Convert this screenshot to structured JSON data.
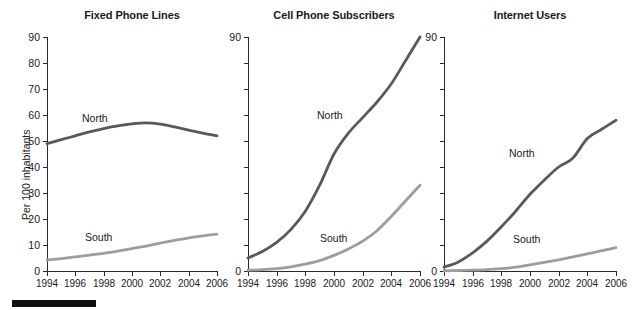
{
  "figure": {
    "width": 626,
    "height": 310,
    "background": "#ffffff",
    "axis_color": "#2a2a2a",
    "text_color": "#1a1a1a",
    "footer_bar_color": "#111111",
    "ylabel": "Per 100 inhabitants"
  },
  "series_colors": {
    "north": "#595959",
    "south": "#9d9d9d"
  },
  "chart_data": [
    {
      "type": "line",
      "title": "Fixed Phone Lines",
      "xlabel": "",
      "ylabel": "Per 100 inhabitants",
      "x": [
        1994,
        1995,
        1996,
        1997,
        1998,
        1999,
        2000,
        2001,
        2002,
        2003,
        2004,
        2005,
        2006
      ],
      "xticks": [
        "1994",
        "1996",
        "1998",
        "2000",
        "2002",
        "2004",
        "2006"
      ],
      "yticks": [
        "0",
        "10",
        "20",
        "30",
        "40",
        "50",
        "60",
        "70",
        "80",
        "90"
      ],
      "ylim": [
        0,
        90
      ],
      "xlim": [
        1994,
        2006
      ],
      "grid": false,
      "legend": "inline-labels",
      "series": [
        {
          "name": "North",
          "color": "#595959",
          "values": [
            49.0,
            50.5,
            52.0,
            53.5,
            54.8,
            55.8,
            56.6,
            57.0,
            56.5,
            55.4,
            54.2,
            53.0,
            52.0
          ]
        },
        {
          "name": "South",
          "color": "#9d9d9d",
          "values": [
            4.3,
            4.8,
            5.4,
            6.1,
            6.8,
            7.6,
            8.6,
            9.6,
            10.7,
            11.8,
            12.7,
            13.5,
            14.2
          ]
        }
      ]
    },
    {
      "type": "line",
      "title": "Cell Phone Subscribers",
      "xlabel": "",
      "ylabel": "",
      "x": [
        1994,
        1995,
        1996,
        1997,
        1998,
        1999,
        2000,
        2001,
        2002,
        2003,
        2004,
        2005,
        2006
      ],
      "xticks": [
        "1994",
        "1996",
        "1998",
        "2000",
        "2002",
        "2004",
        "2006"
      ],
      "yticks": [
        "0",
        "90"
      ],
      "ylim": [
        0,
        90
      ],
      "xlim": [
        1994,
        2006
      ],
      "grid": false,
      "legend": "inline-labels",
      "series": [
        {
          "name": "North",
          "color": "#595959",
          "values": [
            5.0,
            7.5,
            11.0,
            16.0,
            23.0,
            33.0,
            45.0,
            53.0,
            59.0,
            65.0,
            72.0,
            81.0,
            90.0
          ]
        },
        {
          "name": "South",
          "color": "#9d9d9d",
          "values": [
            0.3,
            0.5,
            0.9,
            1.6,
            2.6,
            4.0,
            6.0,
            8.5,
            11.5,
            15.5,
            21.0,
            27.0,
            33.0
          ]
        }
      ]
    },
    {
      "type": "line",
      "title": "Internet Users",
      "xlabel": "",
      "ylabel": "",
      "x": [
        1994,
        1995,
        1996,
        1997,
        1998,
        1999,
        2000,
        2001,
        2002,
        2003,
        2004,
        2005,
        2006
      ],
      "xticks": [
        "1994",
        "1996",
        "1998",
        "2000",
        "2002",
        "2004",
        "2006"
      ],
      "yticks": [
        "0",
        "90"
      ],
      "ylim": [
        0,
        90
      ],
      "xlim": [
        1994,
        2006
      ],
      "grid": false,
      "legend": "inline-labels",
      "series": [
        {
          "name": "North",
          "color": "#595959",
          "values": [
            1.5,
            3.5,
            7.0,
            11.5,
            17.0,
            23.0,
            29.5,
            35.0,
            40.0,
            43.5,
            51.0,
            54.5,
            58.0
          ]
        },
        {
          "name": "South",
          "color": "#9d9d9d",
          "values": [
            0.1,
            0.2,
            0.3,
            0.5,
            0.9,
            1.5,
            2.4,
            3.3,
            4.3,
            5.4,
            6.6,
            7.8,
            9.0
          ]
        }
      ]
    }
  ],
  "panels": [
    {
      "name": "fixed-phone-lines",
      "title": "Fixed Phone Lines",
      "left": 0,
      "plot_left": 47,
      "plot_width": 170,
      "show_all_yticks": true,
      "north_label": {
        "text": "North",
        "x": 82,
        "y": 113
      },
      "south_label": {
        "text": "South",
        "x": 85,
        "y": 232
      }
    },
    {
      "name": "cell-phone-subscribers",
      "title": "Cell Phone Subscribers",
      "left": 228,
      "plot_left": 20,
      "plot_width": 172,
      "show_all_yticks": false,
      "north_label": {
        "text": "North",
        "x": 89,
        "y": 110
      },
      "south_label": {
        "text": "South",
        "x": 92,
        "y": 233
      }
    },
    {
      "name": "internet-users",
      "title": "Internet Users",
      "left": 423,
      "plot_left": 21,
      "plot_width": 172,
      "show_all_yticks": false,
      "north_label": {
        "text": "North",
        "x": 86,
        "y": 148
      },
      "south_label": {
        "text": "South",
        "x": 90,
        "y": 234
      }
    }
  ]
}
